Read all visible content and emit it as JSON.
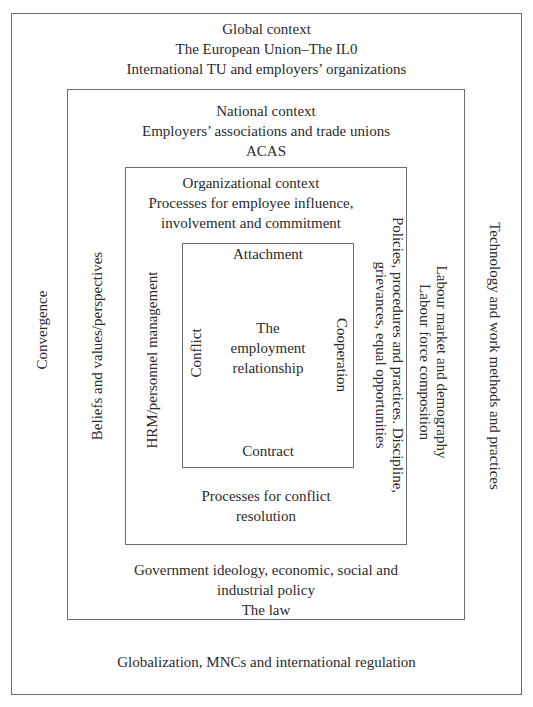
{
  "diagram": {
    "global_context": {
      "title": "Global context",
      "lines": [
        "The European Union–The IL0",
        "International TU and employers’ organizations"
      ],
      "left_label": "Convergence",
      "right_label": "Technology and work methods and practices",
      "bottom_label": "Globalization, MNCs and international regulation"
    },
    "national_context": {
      "title": "National context",
      "lines": [
        "Employers’ associations and trade unions",
        "ACAS"
      ],
      "left_label": "Beliefs and values/perspectives",
      "right_label_lines": [
        "Labour market and demography",
        "Labour force composition"
      ],
      "bottom_lines": [
        "Government ideology, economic, social and",
        "industrial policy",
        "The law"
      ]
    },
    "organizational_context": {
      "title": "Organizational context",
      "lines": [
        "Processes for employee influence,",
        "involvement and commitment"
      ],
      "left_label": "HRM/personnel management",
      "right_label_lines": [
        "Policies, procedures and practices. Discipline,",
        "grievances, equal opportunities"
      ],
      "bottom_lines": [
        "Processes for conflict",
        "resolution"
      ]
    },
    "employment_relationship": {
      "center_lines": [
        "The",
        "employment",
        "relationship"
      ],
      "top_label": "Attachment",
      "bottom_label": "Contract",
      "left_label": "Conflict",
      "right_label": "Cooperation"
    },
    "colors": {
      "border": "#6e6e6e",
      "text": "#2b2b2b",
      "background": "#ffffff"
    }
  }
}
